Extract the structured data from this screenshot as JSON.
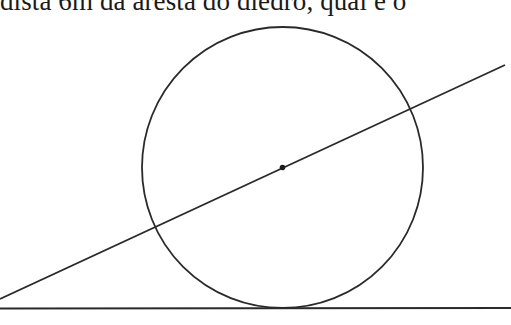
{
  "header_text": {
    "visible_fragment": "dista 6m da aresta do diedro, qual é o"
  },
  "figure": {
    "stroke_color": "#2a2a2a",
    "background": "#ffffff",
    "circle": {
      "cx": 282.5,
      "cy": 167.5,
      "r": 140.5
    },
    "center_point": {
      "cx": 282.5,
      "cy": 167.5,
      "r": 2.8
    },
    "slanted_line": {
      "x1": 0,
      "y1": 299,
      "x2": 505,
      "y2": 65
    },
    "base_line": {
      "x1": 0,
      "y1": 308.5,
      "x2": 511,
      "y2": 308
    }
  }
}
